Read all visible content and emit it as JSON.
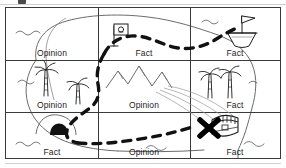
{
  "worksheet": {
    "title": "Treasure Map Fact and Opinion Grid",
    "top_fragment": "cropped-heading-glyph",
    "frame": {
      "columns": 3,
      "rows": 3,
      "border_color": "#3a3a3a"
    },
    "grid": {
      "columns": 3,
      "rows": 3,
      "cells": [
        {
          "row": 0,
          "col": 0,
          "label": "Opinion",
          "icon": "water-waves-icon"
        },
        {
          "row": 0,
          "col": 1,
          "label": "Fact",
          "icon": "flag-marker-icon"
        },
        {
          "row": 0,
          "col": 2,
          "label": "Fact",
          "icon": "sailing-ship-icon"
        },
        {
          "row": 1,
          "col": 0,
          "label": "Opinion",
          "icon": "palm-tree-icon"
        },
        {
          "row": 1,
          "col": 1,
          "label": "Opinion",
          "icon": "mountain-range-icon"
        },
        {
          "row": 1,
          "col": 2,
          "label": "Fact",
          "icon": "palm-tree-pair-icon"
        },
        {
          "row": 2,
          "col": 0,
          "label": "Fact",
          "icon": "cave-entrance-icon"
        },
        {
          "row": 2,
          "col": 1,
          "label": "Opinion",
          "icon": "water-waves-icon"
        },
        {
          "row": 2,
          "col": 2,
          "label": "Fact",
          "icon": "treasure-chest-icon"
        }
      ]
    },
    "labels": {
      "r0c0": "Opinion",
      "r0c1": "Fact",
      "r0c2": "Fact",
      "r1c0": "Opinion",
      "r1c1": "Opinion",
      "r1c2": "Fact",
      "r2c0": "Fact",
      "r2c1": "Opinion",
      "r2c2": "Fact"
    },
    "map_features": {
      "dashed_route": "dashed-treasure-route",
      "start_marker": "flag-marker-icon",
      "end_marker": "x-marks-the-spot-icon",
      "treasure": "treasure-chest-icon",
      "ship": "sailing-ship-icon",
      "mountains": "mountain-range-icon",
      "cave": "cave-entrance-icon",
      "palms": "palm-tree-icon",
      "waves": "water-waves-icon",
      "coastline": "island-coastline-outline"
    },
    "colors": {
      "ink": "#1c1c1c",
      "frame": "#3a3a3a",
      "coast": "#6b6b6b",
      "paper": "#ffffff",
      "dash": "#111111"
    }
  }
}
